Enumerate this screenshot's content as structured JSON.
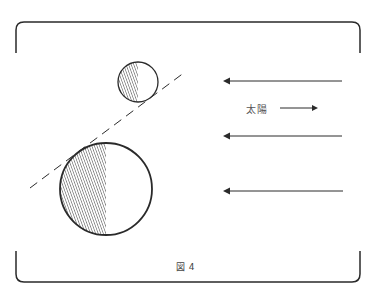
{
  "figure": {
    "caption": "図 4",
    "sun_label": "太陽",
    "colors": {
      "stroke": "#2a2a2a",
      "hatch": "#3a3a3a",
      "background": "#ffffff"
    },
    "elements": {
      "frame": "bracket-frame",
      "small_body": "small-circle-half-shaded",
      "large_body": "large-circle-half-shaded",
      "tangent_line": "dashed-line",
      "rays": [
        "left-arrow",
        "left-arrow",
        "left-arrow"
      ],
      "sun_direction_arrow": "right-arrow"
    }
  }
}
